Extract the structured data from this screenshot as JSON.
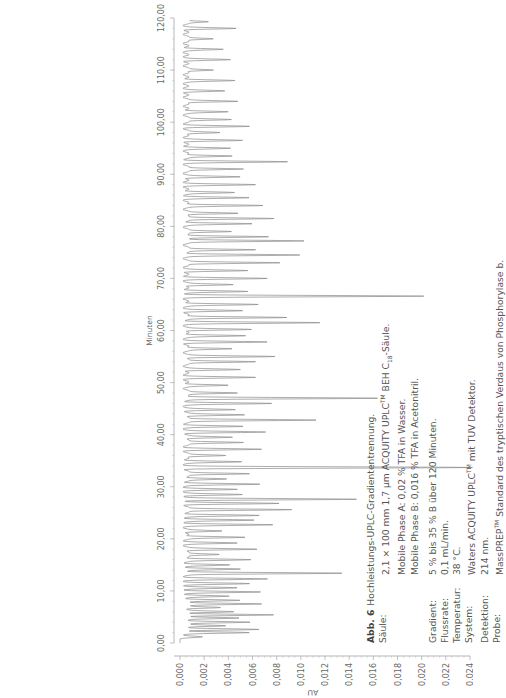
{
  "orientation": "rotated-90-ccw",
  "chart_data": {
    "type": "line",
    "subtype": "chromatogram",
    "title": "Hochleistungs-UPLC-Gradiententrennung",
    "xlabel": "Minuten",
    "ylabel": "AU",
    "xlim": [
      0,
      120
    ],
    "ylim": [
      0.0,
      0.024
    ],
    "x_ticks": [
      "0,00",
      "10,00",
      "20,00",
      "30,00",
      "40,00",
      "50,00",
      "60,00",
      "70,00",
      "80,00",
      "90,00",
      "100,00",
      "110,00",
      "120,00"
    ],
    "y_ticks": [
      "0,000",
      "0,002",
      "0,004",
      "0,006",
      "0,008",
      "0,010",
      "0,012",
      "0,014",
      "0,016",
      "0,018",
      "0,020",
      "0,022",
      "0,024"
    ],
    "grid": false,
    "legend": null,
    "baseline": 0.0005,
    "peaks": [
      {
        "t": 1.2,
        "h": 0.0012
      },
      {
        "t": 2.0,
        "h": 0.005
      },
      {
        "t": 2.6,
        "h": 0.006
      },
      {
        "t": 3.3,
        "h": 0.0035
      },
      {
        "t": 4.0,
        "h": 0.0055
      },
      {
        "t": 4.8,
        "h": 0.0045
      },
      {
        "t": 5.4,
        "h": 0.007
      },
      {
        "t": 6.0,
        "h": 0.004
      },
      {
        "t": 6.8,
        "h": 0.003
      },
      {
        "t": 7.5,
        "h": 0.0065
      },
      {
        "t": 8.2,
        "h": 0.0045
      },
      {
        "t": 9.0,
        "h": 0.0035
      },
      {
        "t": 9.8,
        "h": 0.006
      },
      {
        "t": 10.6,
        "h": 0.004
      },
      {
        "t": 11.4,
        "h": 0.005
      },
      {
        "t": 12.3,
        "h": 0.0065
      },
      {
        "t": 13.4,
        "h": 0.013
      },
      {
        "t": 14.2,
        "h": 0.0045
      },
      {
        "t": 15.0,
        "h": 0.0035
      },
      {
        "t": 16.0,
        "h": 0.0055
      },
      {
        "t": 17.0,
        "h": 0.003
      },
      {
        "t": 18.0,
        "h": 0.006
      },
      {
        "t": 19.2,
        "h": 0.004
      },
      {
        "t": 20.3,
        "h": 0.005
      },
      {
        "t": 21.5,
        "h": 0.003
      },
      {
        "t": 22.7,
        "h": 0.007
      },
      {
        "t": 23.6,
        "h": 0.0055
      },
      {
        "t": 24.5,
        "h": 0.006
      },
      {
        "t": 25.6,
        "h": 0.009
      },
      {
        "t": 26.8,
        "h": 0.0075
      },
      {
        "t": 27.6,
        "h": 0.014
      },
      {
        "t": 28.5,
        "h": 0.0045
      },
      {
        "t": 29.5,
        "h": 0.004
      },
      {
        "t": 30.5,
        "h": 0.006
      },
      {
        "t": 31.5,
        "h": 0.0035
      },
      {
        "t": 32.5,
        "h": 0.0055
      },
      {
        "t": 33.7,
        "h": 0.0235
      },
      {
        "t": 34.8,
        "h": 0.0045
      },
      {
        "t": 36.0,
        "h": 0.0035
      },
      {
        "t": 37.2,
        "h": 0.006
      },
      {
        "t": 38.5,
        "h": 0.005
      },
      {
        "t": 39.5,
        "h": 0.004
      },
      {
        "t": 40.5,
        "h": 0.0065
      },
      {
        "t": 41.6,
        "h": 0.0045
      },
      {
        "t": 42.8,
        "h": 0.011
      },
      {
        "t": 43.8,
        "h": 0.005
      },
      {
        "t": 44.8,
        "h": 0.004
      },
      {
        "t": 46.0,
        "h": 0.007
      },
      {
        "t": 47.0,
        "h": 0.016
      },
      {
        "t": 48.0,
        "h": 0.0045
      },
      {
        "t": 49.5,
        "h": 0.0035
      },
      {
        "t": 51.0,
        "h": 0.0055
      },
      {
        "t": 52.5,
        "h": 0.0045
      },
      {
        "t": 54.0,
        "h": 0.006
      },
      {
        "t": 55.0,
        "h": 0.0075
      },
      {
        "t": 56.5,
        "h": 0.004
      },
      {
        "t": 57.8,
        "h": 0.0065
      },
      {
        "t": 59.0,
        "h": 0.005
      },
      {
        "t": 60.2,
        "h": 0.0055
      },
      {
        "t": 61.5,
        "h": 0.011
      },
      {
        "t": 62.5,
        "h": 0.0085
      },
      {
        "t": 63.8,
        "h": 0.0045
      },
      {
        "t": 65.0,
        "h": 0.006
      },
      {
        "t": 66.6,
        "h": 0.0195
      },
      {
        "t": 67.5,
        "h": 0.005
      },
      {
        "t": 68.8,
        "h": 0.004
      },
      {
        "t": 70.0,
        "h": 0.0065
      },
      {
        "t": 71.5,
        "h": 0.005
      },
      {
        "t": 73.0,
        "h": 0.008
      },
      {
        "t": 74.5,
        "h": 0.0095
      },
      {
        "t": 75.5,
        "h": 0.006
      },
      {
        "t": 77.2,
        "h": 0.01
      },
      {
        "t": 78.0,
        "h": 0.007
      },
      {
        "t": 79.0,
        "h": 0.004
      },
      {
        "t": 80.5,
        "h": 0.0055
      },
      {
        "t": 81.5,
        "h": 0.0075
      },
      {
        "t": 82.5,
        "h": 0.0045
      },
      {
        "t": 84.0,
        "h": 0.0065
      },
      {
        "t": 85.5,
        "h": 0.005
      },
      {
        "t": 86.5,
        "h": 0.004
      },
      {
        "t": 88.0,
        "h": 0.0055
      },
      {
        "t": 89.5,
        "h": 0.0045
      },
      {
        "t": 91.0,
        "h": 0.005
      },
      {
        "t": 92.4,
        "h": 0.0082
      },
      {
        "t": 93.5,
        "h": 0.004
      },
      {
        "t": 95.0,
        "h": 0.0035
      },
      {
        "t": 96.5,
        "h": 0.0045
      },
      {
        "t": 98.0,
        "h": 0.003
      },
      {
        "t": 99.2,
        "h": 0.005
      },
      {
        "t": 100.5,
        "h": 0.004
      },
      {
        "t": 102.0,
        "h": 0.0035
      },
      {
        "t": 104.0,
        "h": 0.0045
      },
      {
        "t": 106.0,
        "h": 0.003
      },
      {
        "t": 108.0,
        "h": 0.004
      },
      {
        "t": 110.0,
        "h": 0.0025
      },
      {
        "t": 112.0,
        "h": 0.0035
      },
      {
        "t": 114.0,
        "h": 0.003
      },
      {
        "t": 116.0,
        "h": 0.0025
      },
      {
        "t": 118.0,
        "h": 0.004
      },
      {
        "t": 119.3,
        "h": 0.002
      }
    ],
    "line_color": "#8a8a8a"
  },
  "axes": {
    "y_title": "AU",
    "x_title": "Minuten"
  },
  "caption": {
    "figure_label": "Abb. 6",
    "figure_title": "Hochleistungs-UPLC-Gradiententrennung.",
    "rows": [
      {
        "key": "Säule:",
        "value": "2,1 × 100 mm 1,7 µm ACQUITY UPLC",
        "sup": "TM",
        "value2": " BEH C",
        "sub": "18",
        "value3": "-Säule."
      },
      {
        "key": "",
        "value": "Mobile Phase A: 0,02 % TFA in Wasser."
      },
      {
        "key": "",
        "value": "Mobile Phase B: 0,016 % TFA in Acetonitril."
      },
      {
        "key": "Gradient:",
        "value": "5 % bis 35 % B über 120 Minuten."
      },
      {
        "key": "Flussrate:",
        "value": "0,1 mL/min."
      },
      {
        "key": "Temperatur:",
        "value": "38 °C."
      },
      {
        "key": "System:",
        "value": "Waters ACQUITY UPLC",
        "sup": "TM",
        "value2": " mit TUV Detektor."
      },
      {
        "key": "Detektion:",
        "value": "214 nm."
      },
      {
        "key": "Probe:",
        "value": "MassPREP",
        "sup": "TM",
        "value2": " Standard des tryptischen Verdaus von Phosphorylase b."
      }
    ]
  }
}
